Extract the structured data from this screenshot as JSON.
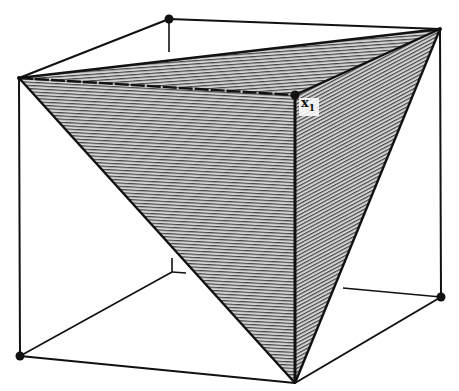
{
  "figure": {
    "type": "cube-with-inscribed-tetrahedron",
    "colors": {
      "background": "#ffffff",
      "stroke": "#111111",
      "hatch": "#333333",
      "hatch_bg": "#d9d9d9",
      "vertex_dot": "#111111"
    },
    "vertices": {
      "top_back_left": [
        169,
        19
      ],
      "top_back_right": [
        440,
        29
      ],
      "top_front_left": [
        19,
        78
      ],
      "top_front_right": [
        295,
        95
      ],
      "bottom_back_left": [
        172,
        272
      ],
      "bottom_back_right": [
        441,
        297
      ],
      "bottom_front_left": [
        20,
        356
      ],
      "bottom_front_right": [
        295,
        383
      ]
    },
    "label": {
      "text": "x",
      "subscript": "1",
      "vertex": "top_front_right"
    }
  }
}
